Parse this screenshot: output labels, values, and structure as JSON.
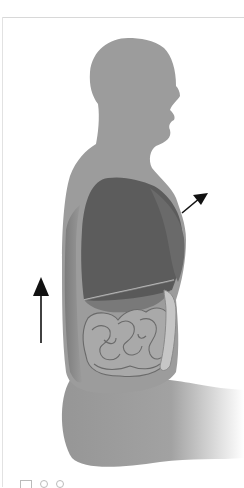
{
  "figure": {
    "title": "Breathing: lungs and diaphragm side view",
    "parts": [
      "head",
      "lungs",
      "diaphragm",
      "intestines",
      "spine"
    ],
    "arrows": [
      {
        "name": "upward-arrow",
        "direction": "up"
      },
      {
        "name": "outward-arrow",
        "direction": "up-right"
      }
    ],
    "colors": {
      "body": "#9a9a9a",
      "lungs": "#5e5e5e",
      "diaphragm_line": "#b8b8b8",
      "intestines": "#a8a8a8",
      "intestine_outline": "#6a6a6a",
      "arrow": "#111111",
      "background": "#ffffff"
    }
  },
  "toolbar": {
    "icons": [
      "expand-icon",
      "circle-icon",
      "circle-icon"
    ]
  }
}
